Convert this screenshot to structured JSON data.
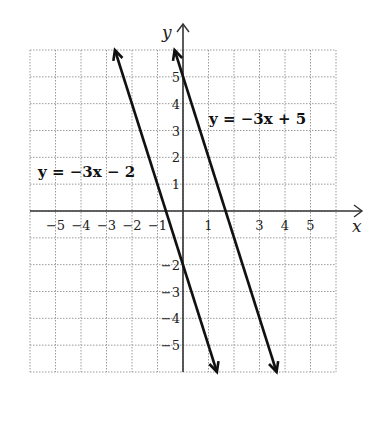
{
  "chart_data": {
    "type": "line",
    "title": "",
    "xlabel": "x",
    "ylabel": "y",
    "xlim": [
      -6,
      6
    ],
    "ylim": [
      -6,
      6
    ],
    "grid": true,
    "x_ticks": [
      "−5",
      "−4",
      "−3",
      "−2",
      "−1",
      "1",
      "3",
      "4",
      "5"
    ],
    "x_tick_values": [
      -5,
      -4,
      -3,
      -2,
      -1,
      1,
      3,
      4,
      5
    ],
    "y_ticks": [
      "5",
      "4",
      "3",
      "2",
      "1",
      "−2",
      "−3",
      "−4",
      "−5"
    ],
    "y_tick_values": [
      5,
      4,
      3,
      2,
      1,
      -2,
      -3,
      -4,
      -5
    ],
    "series": [
      {
        "name": "y = −3x − 2",
        "slope": -3,
        "intercept": -2,
        "x": [
          -2.67,
          1.33
        ],
        "y": [
          6,
          -6
        ]
      },
      {
        "name": "y = −3x + 5",
        "slope": -3,
        "intercept": 5,
        "x": [
          -0.33,
          3.67
        ],
        "y": [
          6,
          -6
        ]
      }
    ],
    "annotations": [
      {
        "text": "y = −3x − 2",
        "near": [
          -4.5,
          1.5
        ]
      },
      {
        "text": "y = −3x + 5",
        "near": [
          2.2,
          3.5
        ]
      }
    ]
  },
  "labels": {
    "x_axis": "x",
    "y_axis": "y",
    "eq1": "y = −3x − 2",
    "eq2": "y = −3x + 5"
  }
}
